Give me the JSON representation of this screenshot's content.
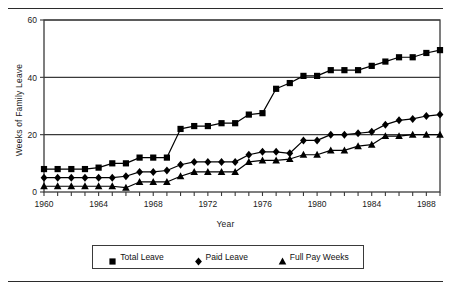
{
  "chart_data": {
    "type": "line",
    "title": "",
    "xlabel": "Year",
    "ylabel": "Weeks of Family Leave",
    "xlim": [
      1960,
      1989
    ],
    "ylim": [
      0,
      60
    ],
    "yticks": [
      0,
      20,
      40,
      60
    ],
    "xticks_labeled": [
      1960,
      1964,
      1968,
      1972,
      1976,
      1980,
      1984,
      1988
    ],
    "xtick_step": 1,
    "grid": "horizontal",
    "legend_position": "bottom",
    "x": [
      1960,
      1961,
      1962,
      1963,
      1964,
      1965,
      1966,
      1967,
      1968,
      1969,
      1970,
      1971,
      1972,
      1973,
      1974,
      1975,
      1976,
      1977,
      1978,
      1979,
      1980,
      1981,
      1982,
      1983,
      1984,
      1985,
      1986,
      1987,
      1988,
      1989
    ],
    "series": [
      {
        "name": "Total Leave",
        "marker": "square",
        "color": "#000000",
        "values": [
          8,
          8,
          8,
          8,
          8.5,
          10,
          10,
          12,
          12,
          12,
          22,
          23,
          23,
          24,
          24,
          27,
          27.5,
          36,
          38,
          40.5,
          40.5,
          42.5,
          42.5,
          42.5,
          44,
          45.5,
          47,
          47,
          48.5,
          49.5
        ]
      },
      {
        "name": "Paid Leave",
        "marker": "diamond",
        "color": "#000000",
        "values": [
          5,
          5,
          5,
          5,
          5,
          5,
          5.5,
          7,
          7,
          7.5,
          9.5,
          10.5,
          10.5,
          10.5,
          10.5,
          13,
          14,
          14,
          13.5,
          18,
          18,
          20,
          20,
          20.5,
          21,
          23.5,
          25,
          25.5,
          26.5,
          27
        ]
      },
      {
        "name": "Full Pay Weeks",
        "marker": "triangle",
        "color": "#000000",
        "values": [
          2,
          2,
          2,
          2,
          2,
          2,
          1.5,
          3.5,
          3.5,
          3.5,
          5.5,
          7,
          7,
          7,
          7,
          10.5,
          11,
          11,
          11.5,
          13,
          13,
          14.5,
          14.5,
          16,
          16.5,
          19.5,
          19.5,
          20,
          20,
          20
        ]
      }
    ]
  },
  "legend": {
    "items": [
      {
        "label": "Total Leave",
        "marker": "square"
      },
      {
        "label": "Paid Leave",
        "marker": "diamond"
      },
      {
        "label": "Full Pay Weeks",
        "marker": "triangle"
      }
    ]
  }
}
